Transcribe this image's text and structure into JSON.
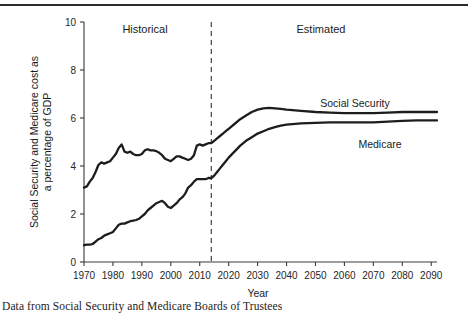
{
  "caption": "Data from Social Security and Medicare Boards of Trustees",
  "annotations": {
    "historical": "Historical",
    "estimated": "Estimated",
    "divider_year": 2014
  },
  "chart_data": {
    "type": "line",
    "title": "",
    "xlabel": "Year",
    "ylabel": "Social Security and Medicare cost as a percentage of GDP",
    "ylabel_lines": [
      "Social Security and Medicare cost as",
      "a percentage of GDP"
    ],
    "xlim": [
      1970,
      2092
    ],
    "ylim": [
      0,
      10
    ],
    "xticks": [
      1970,
      1980,
      1990,
      2000,
      2010,
      2020,
      2030,
      2040,
      2050,
      2060,
      2070,
      2080,
      2090
    ],
    "xticklabels": [
      "1970",
      "1980",
      "1990",
      "2000",
      "2010",
      "2020",
      "2030",
      "2040",
      "2050",
      "2060",
      "2070",
      "2080",
      "2090"
    ],
    "yticks": [
      0,
      2,
      4,
      6,
      8,
      10
    ],
    "yticklabels": [
      "0",
      "2",
      "4",
      "6",
      "8",
      "10"
    ],
    "grid": false,
    "legend_position": "inline-labels",
    "line_color": "#1d1d1d",
    "series": [
      {
        "name": "Social Security",
        "label": "Social Security",
        "x": [
          1970,
          1971,
          1972,
          1973,
          1974,
          1975,
          1976,
          1977,
          1978,
          1979,
          1980,
          1981,
          1982,
          1983,
          1984,
          1985,
          1986,
          1987,
          1988,
          1989,
          1990,
          1991,
          1992,
          1993,
          1994,
          1995,
          1996,
          1997,
          1998,
          1999,
          2000,
          2001,
          2002,
          2003,
          2004,
          2005,
          2006,
          2007,
          2008,
          2009,
          2010,
          2011,
          2012,
          2013,
          2014,
          2015,
          2016,
          2017,
          2018,
          2019,
          2020,
          2022,
          2024,
          2026,
          2028,
          2030,
          2032,
          2034,
          2036,
          2038,
          2040,
          2045,
          2050,
          2055,
          2060,
          2065,
          2070,
          2075,
          2080,
          2085,
          2090,
          2092
        ],
        "y": [
          3.1,
          3.15,
          3.35,
          3.5,
          3.75,
          4.05,
          4.15,
          4.1,
          4.15,
          4.2,
          4.35,
          4.5,
          4.75,
          4.9,
          4.6,
          4.55,
          4.6,
          4.5,
          4.45,
          4.45,
          4.5,
          4.65,
          4.7,
          4.65,
          4.65,
          4.62,
          4.55,
          4.45,
          4.3,
          4.25,
          4.2,
          4.3,
          4.4,
          4.4,
          4.35,
          4.3,
          4.25,
          4.3,
          4.45,
          4.85,
          4.9,
          4.85,
          4.9,
          4.95,
          4.95,
          5.05,
          5.15,
          5.25,
          5.35,
          5.45,
          5.55,
          5.75,
          5.95,
          6.1,
          6.25,
          6.35,
          6.4,
          6.42,
          6.4,
          6.38,
          6.35,
          6.3,
          6.25,
          6.22,
          6.2,
          6.2,
          6.2,
          6.22,
          6.25,
          6.25,
          6.25,
          6.25
        ]
      },
      {
        "name": "Medicare",
        "label": "Medicare",
        "x": [
          1970,
          1971,
          1972,
          1973,
          1974,
          1975,
          1976,
          1977,
          1978,
          1979,
          1980,
          1981,
          1982,
          1983,
          1984,
          1985,
          1986,
          1987,
          1988,
          1989,
          1990,
          1991,
          1992,
          1993,
          1994,
          1995,
          1996,
          1997,
          1998,
          1999,
          2000,
          2001,
          2002,
          2003,
          2004,
          2005,
          2006,
          2007,
          2008,
          2009,
          2010,
          2011,
          2012,
          2013,
          2014,
          2015,
          2016,
          2017,
          2018,
          2019,
          2020,
          2022,
          2024,
          2026,
          2028,
          2030,
          2032,
          2034,
          2036,
          2038,
          2040,
          2045,
          2050,
          2055,
          2060,
          2065,
          2070,
          2075,
          2080,
          2085,
          2090,
          2092
        ],
        "y": [
          0.7,
          0.72,
          0.72,
          0.75,
          0.85,
          0.95,
          1.0,
          1.1,
          1.15,
          1.2,
          1.25,
          1.4,
          1.55,
          1.6,
          1.6,
          1.65,
          1.7,
          1.72,
          1.75,
          1.8,
          1.9,
          2.0,
          2.15,
          2.25,
          2.35,
          2.45,
          2.5,
          2.55,
          2.45,
          2.3,
          2.25,
          2.35,
          2.45,
          2.6,
          2.7,
          2.85,
          3.1,
          3.2,
          3.35,
          3.45,
          3.45,
          3.45,
          3.45,
          3.5,
          3.5,
          3.6,
          3.75,
          3.9,
          4.05,
          4.2,
          4.35,
          4.6,
          4.85,
          5.05,
          5.2,
          5.35,
          5.45,
          5.55,
          5.62,
          5.68,
          5.72,
          5.78,
          5.8,
          5.82,
          5.82,
          5.82,
          5.82,
          5.85,
          5.88,
          5.9,
          5.9,
          5.9
        ]
      }
    ]
  }
}
